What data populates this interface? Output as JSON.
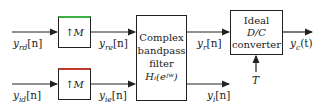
{
  "diagram": {
    "blocks": {
      "upsampler_top": {
        "label": "↑M",
        "accent": "#3cb043"
      },
      "upsampler_bottom": {
        "label": "↑M",
        "accent": "#c0392b"
      },
      "filter": {
        "lines": [
          "Complex",
          "bandpass",
          "filter",
          "Hᵢ(eʲʷ)"
        ]
      },
      "dc": {
        "lines": [
          "Ideal",
          "D/C",
          "converter"
        ]
      }
    },
    "signals": {
      "y_rd": {
        "base": "y",
        "sub": "rd",
        "arg": "[n]"
      },
      "y_id": {
        "base": "y",
        "sub": "id",
        "arg": "[n]"
      },
      "y_re": {
        "base": "y",
        "sub": "re",
        "arg": "[n]"
      },
      "y_ie": {
        "base": "y",
        "sub": "ie",
        "arg": "[n]"
      },
      "y_r": {
        "base": "y",
        "sub": "r",
        "arg": "[n]"
      },
      "y_i": {
        "base": "y",
        "sub": "i",
        "arg": "[n]"
      },
      "y_c": {
        "base": "y",
        "sub": "c",
        "arg": "(t)"
      },
      "T": {
        "base": "T"
      }
    }
  }
}
